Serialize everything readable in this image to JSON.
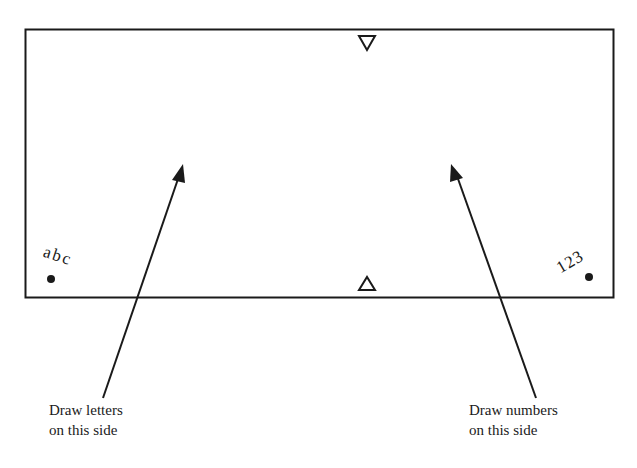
{
  "diagram": {
    "left_marker_text": "abc",
    "right_marker_text": "123",
    "left_label": {
      "line1": "Draw letters",
      "line2": "on this side"
    },
    "right_label": {
      "line1": "Draw numbers",
      "line2": "on this side"
    },
    "top_marker": "down-pointing triangle",
    "bottom_marker": "up-pointing triangle",
    "stroke_color": "#1a1a1a"
  }
}
